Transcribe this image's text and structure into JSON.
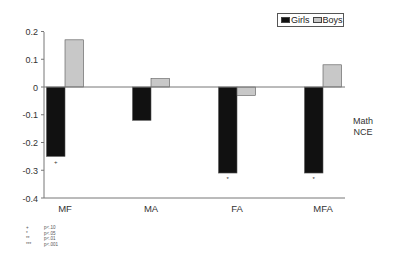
{
  "chart_data": {
    "type": "bar",
    "title": "",
    "xlabel": "",
    "ylabel": "Math NCE",
    "ylim": [
      -0.4,
      0.2
    ],
    "yticks": [
      0.2,
      0.1,
      0,
      -0.1,
      -0.2,
      -0.3,
      -0.4
    ],
    "ytick_labels": [
      "0.2",
      "0.1",
      "0",
      "-0.1",
      "-0.2",
      "-0.3",
      "-0.4"
    ],
    "grid": false,
    "legend_position": "top-right",
    "categories": [
      "MF",
      "MA",
      "FA",
      "MFA"
    ],
    "series": [
      {
        "name": "Girls",
        "color": "#111111",
        "values": [
          -0.25,
          -0.12,
          -0.31,
          -0.31
        ],
        "significance": [
          "+",
          "",
          "*",
          "*"
        ]
      },
      {
        "name": "Boys",
        "color": "#c8c8c8",
        "values": [
          0.17,
          0.03,
          -0.03,
          0.08
        ],
        "significance": [
          "",
          "",
          "",
          ""
        ]
      }
    ],
    "significance_legend": [
      {
        "symbol": "+",
        "label": "p<.10"
      },
      {
        "symbol": "*",
        "label": "p<.05"
      },
      {
        "symbol": "**",
        "label": "p<.01"
      },
      {
        "symbol": "***",
        "label": "p<.001"
      }
    ]
  },
  "legend": {
    "girls_label": "Girls",
    "boys_label": "Boys"
  },
  "ylabel_lines": [
    "Math",
    "NCE"
  ],
  "footnote": [
    {
      "symbol": "+",
      "label": "p<.10"
    },
    {
      "symbol": "*",
      "label": "p<.05"
    },
    {
      "symbol": "**",
      "label": "p<.01"
    },
    {
      "symbol": "***",
      "label": "p<.001"
    }
  ]
}
